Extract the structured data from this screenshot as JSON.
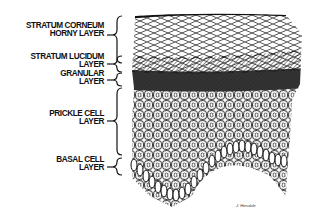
{
  "figure": {
    "labels": [
      {
        "id": "corneum",
        "lines": [
          "STRATUM CORNEUM",
          "HORNY LAYER"
        ],
        "top": 22
      },
      {
        "id": "lucidum",
        "lines": [
          "STRATUM LUCIDUM",
          "LAYER"
        ],
        "top": 53
      },
      {
        "id": "granular",
        "lines": [
          "GRANULAR",
          "LAYER"
        ],
        "top": 70
      },
      {
        "id": "prickle",
        "lines": [
          "PRICKLE CELL",
          "LAYER"
        ],
        "top": 110
      },
      {
        "id": "basal",
        "lines": [
          "BASAL CELL",
          "LAYER"
        ],
        "top": 156
      }
    ],
    "signature": "J. Hinsdale"
  },
  "colors": {
    "ink": "#111111",
    "background": "#ffffff",
    "stipple": "#9a9a9a"
  }
}
